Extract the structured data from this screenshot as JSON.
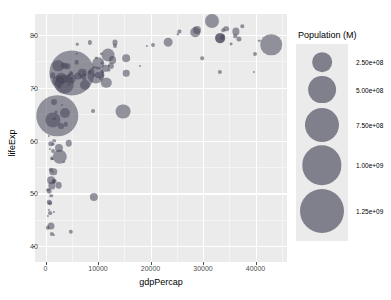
{
  "chart_data": {
    "type": "scatter",
    "title": "",
    "xlabel": "gdpPercap",
    "ylabel": "lifeExp",
    "xlim": [
      -2000,
      46000
    ],
    "ylim": [
      37,
      84
    ],
    "xticks": [
      "0",
      "10000",
      "20000",
      "30000",
      "40000"
    ],
    "xtick_values": [
      0,
      10000,
      20000,
      30000,
      40000
    ],
    "yticks": [
      "40",
      "50",
      "60",
      "70",
      "80"
    ],
    "ytick_values": [
      40,
      50,
      60,
      70,
      80
    ],
    "grid": true,
    "bubble_color": "#46465a",
    "panel_color": "#ebebeb",
    "size_encoding": "pop",
    "legend": {
      "position": "right",
      "title": "Population (M)",
      "entries": [
        {
          "label": "2.50e+08",
          "value": 250000000
        },
        {
          "label": "5.00e+08",
          "value": 500000000
        },
        {
          "label": "7.50e+08",
          "value": 750000000
        },
        {
          "label": "1.00e+09",
          "value": 1000000000
        },
        {
          "label": "1.25e+09",
          "value": 1250000000
        }
      ]
    },
    "points": [
      {
        "x": 974,
        "y": 43.8,
        "pop": 31889923
      },
      {
        "x": 5937,
        "y": 76.4,
        "pop": 3600523
      },
      {
        "x": 6223,
        "y": 72.3,
        "pop": 33333216
      },
      {
        "x": 4797,
        "y": 42.7,
        "pop": 12420476
      },
      {
        "x": 12779,
        "y": 75.3,
        "pop": 40301927
      },
      {
        "x": 34435,
        "y": 81.2,
        "pop": 20434176
      },
      {
        "x": 36126,
        "y": 79.8,
        "pop": 8199783
      },
      {
        "x": 29796,
        "y": 75.6,
        "pop": 8361808
      },
      {
        "x": 1391,
        "y": 64.1,
        "pop": 708573
      },
      {
        "x": 1441,
        "y": 64.0,
        "pop": 150448339
      },
      {
        "x": 33693,
        "y": 79.4,
        "pop": 10392226
      },
      {
        "x": 1217,
        "y": 56.7,
        "pop": 8078314
      },
      {
        "x": 430,
        "y": 50.7,
        "pop": 9119152
      },
      {
        "x": 1713,
        "y": 52.3,
        "pop": 4552198
      },
      {
        "x": 9066,
        "y": 65.6,
        "pop": 9925891
      },
      {
        "x": 9253,
        "y": 72.4,
        "pop": 4552198
      },
      {
        "x": 4959,
        "y": 71.8,
        "pop": 1639131
      },
      {
        "x": 39725,
        "y": 73.0,
        "pop": 390000
      },
      {
        "x": 9645,
        "y": 72.4,
        "pop": 190010647
      },
      {
        "x": 10680,
        "y": 73.0,
        "pop": 7322858
      },
      {
        "x": 1713,
        "y": 52.3,
        "pop": 14326203
      },
      {
        "x": 1044,
        "y": 49.6,
        "pop": 8390505
      },
      {
        "x": 759,
        "y": 50.4,
        "pop": 14131858
      },
      {
        "x": 36319,
        "y": 80.7,
        "pop": 33390141
      },
      {
        "x": 13171,
        "y": 78.6,
        "pop": 16284741
      },
      {
        "x": 4959,
        "y": 72.9,
        "pop": 4369
      },
      {
        "x": 4797,
        "y": 72.9,
        "pop": 11416987
      },
      {
        "x": 4959,
        "y": 72.9,
        "pop": 1318683096
      },
      {
        "x": 7007,
        "y": 72.9,
        "pop": 44227550
      },
      {
        "x": 1598,
        "y": 46.5,
        "pop": 710960
      },
      {
        "x": 3632,
        "y": 65.2,
        "pop": 64606759
      },
      {
        "x": 9645,
        "y": 75.7,
        "pop": 3800610
      },
      {
        "x": 6025,
        "y": 78.3,
        "pop": 4133884
      },
      {
        "x": 10808,
        "y": 72.2,
        "pop": 4493312
      },
      {
        "x": 33207,
        "y": 73.0,
        "pop": 11416987
      },
      {
        "x": 39975,
        "y": 76.5,
        "pop": 10228744
      },
      {
        "x": 35278,
        "y": 78.3,
        "pop": 5468120
      },
      {
        "x": 1391,
        "y": 54.1,
        "pop": 496374
      },
      {
        "x": 6873,
        "y": 72.0,
        "pop": 9319622
      },
      {
        "x": 5937,
        "y": 74.9,
        "pop": 13755680
      },
      {
        "x": 2452,
        "y": 71.3,
        "pop": 80264543
      },
      {
        "x": 7408,
        "y": 71.8,
        "pop": 6939688
      },
      {
        "x": 3548,
        "y": 56.0,
        "pop": 551201
      },
      {
        "x": 1441,
        "y": 59.4,
        "pop": 4906585
      },
      {
        "x": 12154,
        "y": 74.2,
        "pop": 1056608
      },
      {
        "x": 33207,
        "y": 79.4,
        "pop": 61083916
      },
      {
        "x": 1327,
        "y": 56.5,
        "pop": 1454867
      },
      {
        "x": 13206,
        "y": 77.9,
        "pop": 10706290
      },
      {
        "x": 8458,
        "y": 78.6,
        "pop": 11416987
      },
      {
        "x": 1441,
        "y": 58.0,
        "pop": 9947814
      },
      {
        "x": 1704,
        "y": 60.0,
        "pop": 8502814
      },
      {
        "x": 706,
        "y": 60.9,
        "pop": 1688
      },
      {
        "x": 2602,
        "y": 70.2,
        "pop": 7483763
      },
      {
        "x": 2280,
        "y": 64.7,
        "pop": 1110396331
      },
      {
        "x": 3541,
        "y": 70.7,
        "pop": 223547000
      },
      {
        "x": 11605,
        "y": 71.0,
        "pop": 69453570
      },
      {
        "x": 4471,
        "y": 59.5,
        "pop": 27499638
      },
      {
        "x": 40676,
        "y": 78.9,
        "pop": 4109086
      },
      {
        "x": 25523,
        "y": 80.7,
        "pop": 6426679
      },
      {
        "x": 28569,
        "y": 80.5,
        "pop": 58147733
      },
      {
        "x": 7320,
        "y": 72.6,
        "pop": 2780132
      },
      {
        "x": 31656,
        "y": 82.6,
        "pop": 127467972
      },
      {
        "x": 4519,
        "y": 72.5,
        "pop": 6053193
      },
      {
        "x": 1463,
        "y": 54.1,
        "pop": 35610177
      },
      {
        "x": 1593,
        "y": 67.3,
        "pop": 23301725
      },
      {
        "x": 23348,
        "y": 78.6,
        "pop": 49044790
      },
      {
        "x": 47307,
        "y": 77.6,
        "pop": 2505559
      },
      {
        "x": 10461,
        "y": 71.8,
        "pop": 3921278
      },
      {
        "x": 1569,
        "y": 42.1,
        "pop": 2012649
      },
      {
        "x": 414,
        "y": 45.7,
        "pop": 3193942
      },
      {
        "x": 12057,
        "y": 73.4,
        "pop": 6036914
      },
      {
        "x": 1044,
        "y": 59.4,
        "pop": 19167654
      },
      {
        "x": 759,
        "y": 48.3,
        "pop": 13327079
      },
      {
        "x": 12451,
        "y": 74.2,
        "pop": 24821286
      },
      {
        "x": 1042,
        "y": 54.5,
        "pop": 12031795
      },
      {
        "x": 1803,
        "y": 64.2,
        "pop": 3270065
      },
      {
        "x": 10956,
        "y": 72.5,
        "pop": 1250882
      },
      {
        "x": 11977,
        "y": 76.2,
        "pop": 108700891
      },
      {
        "x": 3095,
        "y": 66.8,
        "pop": 2874127
      },
      {
        "x": 9253,
        "y": 74.0,
        "pop": 620020
      },
      {
        "x": 3820,
        "y": 71.2,
        "pop": 3304195
      },
      {
        "x": 4811,
        "y": 71.7,
        "pop": 71158647
      },
      {
        "x": 1202,
        "y": 51.5,
        "pop": 33757175
      },
      {
        "x": 36798,
        "y": 79.3,
        "pop": 16570613
      },
      {
        "x": 25185,
        "y": 80.2,
        "pop": 4115771
      },
      {
        "x": 2749,
        "y": 56.9,
        "pop": 135031164
      },
      {
        "x": 619,
        "y": 46.9,
        "pop": 13619
      },
      {
        "x": 2013,
        "y": 65.5,
        "pop": 5675356
      },
      {
        "x": 7409,
        "y": 72.4,
        "pop": 6667147
      },
      {
        "x": 3548,
        "y": 74.2,
        "pop": 28674757
      },
      {
        "x": 15390,
        "y": 75.6,
        "pop": 38518241
      },
      {
        "x": 20510,
        "y": 78.1,
        "pop": 10642836
      },
      {
        "x": 10808,
        "y": 72.8,
        "pop": 3942491
      },
      {
        "x": 10000,
        "y": 72.5,
        "pop": 22276056
      },
      {
        "x": 14786,
        "y": 65.5,
        "pop": 142958164
      },
      {
        "x": 863,
        "y": 46.2,
        "pop": 9230783
      },
      {
        "x": 15390,
        "y": 72.8,
        "pop": 27601038
      },
      {
        "x": 3820,
        "y": 63.1,
        "pop": 12267493
      },
      {
        "x": 10062,
        "y": 74.7,
        "pop": 85262356
      },
      {
        "x": 33860,
        "y": 79.9,
        "pop": 4553009
      },
      {
        "x": 10808,
        "y": 74.7,
        "pop": 5447502
      },
      {
        "x": 19328,
        "y": 77.9,
        "pop": 2009245
      },
      {
        "x": 926,
        "y": 48.2,
        "pop": 9118773
      },
      {
        "x": 9270,
        "y": 49.3,
        "pop": 43997828
      },
      {
        "x": 28821,
        "y": 80.9,
        "pop": 40448191
      },
      {
        "x": 1391,
        "y": 72.4,
        "pop": 20378239
      },
      {
        "x": 2602,
        "y": 58.6,
        "pop": 42292929
      },
      {
        "x": 7093,
        "y": 73.0,
        "pop": 468525
      },
      {
        "x": 33859,
        "y": 80.9,
        "pop": 9031088
      },
      {
        "x": 37506,
        "y": 81.7,
        "pop": 7554661
      },
      {
        "x": 4184,
        "y": 74.1,
        "pop": 18606156
      },
      {
        "x": 4519,
        "y": 70.6,
        "pop": 6744
      },
      {
        "x": 1107,
        "y": 52.5,
        "pop": 38139640
      },
      {
        "x": 7458,
        "y": 70.6,
        "pop": 65068149
      },
      {
        "x": 882,
        "y": 58.4,
        "pop": 6376
      },
      {
        "x": 18009,
        "y": 74.2,
        "pop": 1056608
      },
      {
        "x": 8458,
        "y": 73.0,
        "pop": 10276158
      },
      {
        "x": 3025,
        "y": 71.8,
        "pop": 71158647
      },
      {
        "x": 2497,
        "y": 51.5,
        "pop": 29170398
      },
      {
        "x": 33203,
        "y": 79.4,
        "pop": 60776238
      },
      {
        "x": 42951,
        "y": 78.2,
        "pop": 301139947
      },
      {
        "x": 10611,
        "y": 76.4,
        "pop": 3447496
      },
      {
        "x": 11416,
        "y": 73.7,
        "pop": 26084662
      },
      {
        "x": 2442,
        "y": 74.2,
        "pop": 85262356
      },
      {
        "x": 3025,
        "y": 62.7,
        "pop": 22211743
      },
      {
        "x": 1271,
        "y": 42.4,
        "pop": 11746035
      },
      {
        "x": 469,
        "y": 43.5,
        "pop": 12311143
      }
    ]
  }
}
